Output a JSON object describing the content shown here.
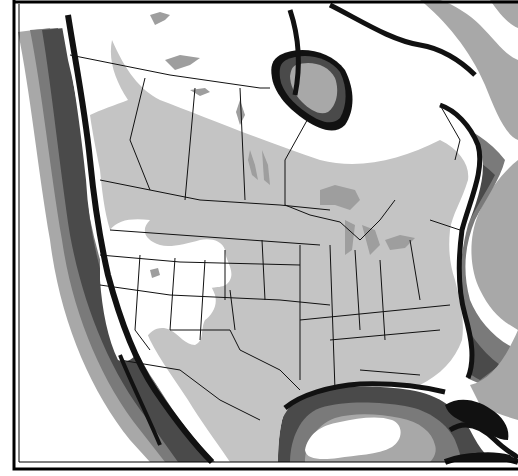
{
  "map": {
    "title": "North America range map",
    "subject": "Distribution range (shaded) over North America with ocean depth shading",
    "colors": {
      "background": "#ffffff",
      "land": "#ffffff",
      "range": "#c4c4c4",
      "lakes": "#9e9e9e",
      "coast": "#111111",
      "shelf_dark": "#4a4a4a",
      "shelf_mid": "#7a7a7a",
      "shelf_light": "#a8a8a8",
      "open_ocean": "#ffffff",
      "border_lines": "#111111",
      "frame": "#000000"
    },
    "legend": [],
    "regions": [
      {
        "name": "Canada (south-central)",
        "status": "in-range"
      },
      {
        "name": "Contiguous United States",
        "status": "in-range (except Great Basin / Pacific coast)"
      },
      {
        "name": "Mexico (north)",
        "status": "in-range"
      },
      {
        "name": "Northern Canada / Arctic",
        "status": "out-of-range"
      },
      {
        "name": "Pacific coast & Great Basin",
        "status": "out-of-range"
      }
    ],
    "water_bodies": [
      "Pacific Ocean",
      "Hudson Bay",
      "Atlantic Ocean",
      "Gulf of Mexico",
      "Great Lakes",
      "Caribbean"
    ]
  }
}
